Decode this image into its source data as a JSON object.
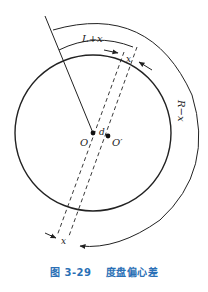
{
  "figure": {
    "caption_number": "图 3-29",
    "caption_title": "度盘偏心差",
    "caption_color": "#2a6fb5",
    "line_color": "#222222",
    "labels": {
      "arc_inner": "L+x",
      "arc_outer": "R−x",
      "offset_top": "x",
      "offset_bottom": "x",
      "eccentricity": "d",
      "center_true": "O",
      "center_offset": "O′"
    }
  }
}
